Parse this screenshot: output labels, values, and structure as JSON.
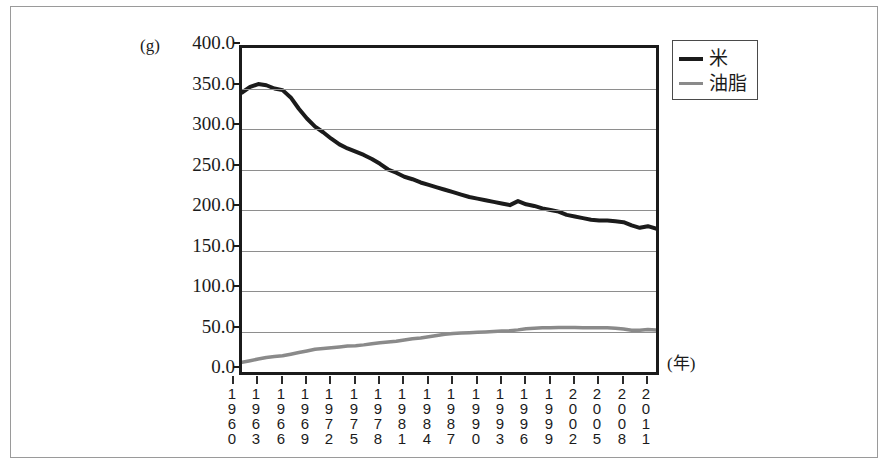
{
  "chart_data": {
    "type": "line",
    "title": "",
    "xlabel": "(年)",
    "ylabel": "(g)",
    "ylim": [
      0,
      400
    ],
    "ytick_step": 50,
    "yticks": [
      "400.0",
      "350.0",
      "300.0",
      "250.0",
      "200.0",
      "150.0",
      "100.0",
      "50.0",
      "0.0"
    ],
    "grid": true,
    "legend_position": "top-right",
    "x_tick_labels": [
      "1960",
      "1963",
      "1966",
      "1969",
      "1972",
      "1975",
      "1978",
      "1981",
      "1984",
      "1987",
      "1990",
      "1993",
      "1996",
      "1999",
      "2002",
      "2005",
      "2008",
      "2011"
    ],
    "x": [
      1960,
      1961,
      1962,
      1963,
      1964,
      1965,
      1966,
      1967,
      1968,
      1969,
      1970,
      1971,
      1972,
      1973,
      1974,
      1975,
      1976,
      1977,
      1978,
      1979,
      1980,
      1981,
      1982,
      1983,
      1984,
      1985,
      1986,
      1987,
      1988,
      1989,
      1990,
      1991,
      1992,
      1993,
      1994,
      1995,
      1996,
      1997,
      1998,
      1999,
      2000,
      2001,
      2002,
      2003,
      2004,
      2005,
      2006,
      2007,
      2008,
      2009,
      2010,
      2011
    ],
    "series": [
      {
        "name": "米",
        "color": "#1b1b1b",
        "values": [
          345.0,
          352.0,
          355.5,
          354.0,
          350.0,
          348.0,
          339.0,
          325.0,
          313.0,
          303.0,
          296.0,
          288.0,
          281.0,
          276.0,
          272.0,
          268.0,
          263.0,
          257.0,
          250.0,
          246.0,
          241.0,
          238.0,
          234.0,
          231.0,
          228.0,
          225.0,
          222.0,
          219.0,
          216.0,
          214.0,
          212.0,
          210.0,
          208.0,
          206.0,
          211.0,
          207.0,
          205.0,
          202.0,
          200.0,
          198.0,
          194.0,
          192.0,
          190.0,
          188.0,
          187.0,
          187.0,
          186.0,
          185.0,
          181.0,
          178.0,
          180.0,
          177.0
        ]
      },
      {
        "name": "油脂",
        "color": "#8a8a8a",
        "values": [
          12.0,
          14.0,
          16.0,
          18.0,
          19.0,
          20.0,
          22.0,
          24.0,
          26.0,
          28.0,
          29.0,
          30.0,
          31.0,
          32.0,
          32.5,
          33.5,
          35.0,
          36.0,
          37.0,
          38.0,
          39.5,
          41.0,
          42.0,
          43.5,
          45.0,
          46.5,
          47.5,
          48.0,
          48.5,
          49.0,
          49.5,
          50.0,
          50.5,
          51.0,
          52.0,
          53.5,
          54.0,
          54.5,
          54.5,
          55.0,
          55.0,
          55.0,
          54.5,
          54.5,
          54.5,
          54.5,
          54.0,
          53.0,
          51.5,
          51.5,
          52.5,
          52.0
        ]
      }
    ]
  },
  "legend": {
    "entries": [
      {
        "label": "米",
        "swatch": "rice-line-swatch"
      },
      {
        "label": "油脂",
        "swatch": "oil-line-swatch"
      }
    ]
  },
  "axis": {
    "y_unit": "(g)",
    "x_unit": "(年)"
  },
  "colors": {
    "rice_line": "#1b1b1b",
    "oil_line": "#8a8a8a",
    "gridline": "#8e8e8e",
    "axis": "#1b1b1b",
    "frame": "#9a9a9a"
  }
}
